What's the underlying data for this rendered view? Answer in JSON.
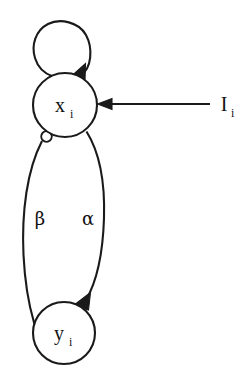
{
  "figure": {
    "type": "neural-circuit-diagram",
    "background_color": "#ffffff",
    "stroke_color": "#1a1a1a",
    "nodes": [
      {
        "id": "x",
        "label": "x",
        "subscript": "i",
        "cx": 65,
        "cy": 105,
        "r": 32
      },
      {
        "id": "y",
        "label": "y",
        "subscript": "i",
        "cx": 64,
        "cy": 333,
        "r": 31
      }
    ],
    "edges": [
      {
        "id": "self-loop-x",
        "from": "x",
        "to": "x",
        "terminal": "arrow",
        "label": ""
      },
      {
        "id": "x-to-y-alpha",
        "from": "x",
        "to": "y",
        "terminal": "arrow",
        "label": "α",
        "label_x": 88,
        "label_y": 218
      },
      {
        "id": "y-to-x-beta",
        "from": "y",
        "to": "x",
        "terminal": "inhibitory-circle",
        "label": "β",
        "label_x": 40,
        "label_y": 218
      }
    ],
    "input": {
      "id": "external-input",
      "label": "I",
      "subscript": "i",
      "target": "x",
      "terminal": "arrow",
      "line_start_x": 210,
      "line_end_x": 99,
      "line_y": 104,
      "label_x": 227,
      "label_y": 111
    }
  }
}
